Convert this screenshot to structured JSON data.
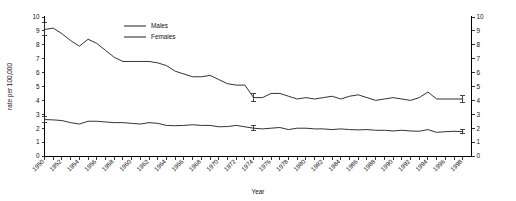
{
  "chart_data": {
    "type": "line",
    "title": "",
    "xlabel": "Year",
    "ylabel": "rate per 100,000",
    "xlim": [
      1950,
      1999
    ],
    "ylim": [
      0,
      10
    ],
    "yticks": [
      0,
      1,
      2,
      3,
      4,
      5,
      6,
      7,
      8,
      9,
      10
    ],
    "ytick_labels": [
      "0",
      "1",
      "2",
      "3",
      "4",
      "5",
      "6",
      "7",
      "8",
      "9",
      "10"
    ],
    "right_axis_mirrored": true,
    "grid": false,
    "legend_position": "top-center",
    "minor_tick_every_year": true,
    "x": [
      1950,
      1951,
      1952,
      1953,
      1954,
      1955,
      1956,
      1957,
      1958,
      1959,
      1960,
      1961,
      1962,
      1963,
      1964,
      1965,
      1966,
      1967,
      1968,
      1969,
      1970,
      1971,
      1972,
      1973,
      1974,
      1975,
      1976,
      1977,
      1978,
      1979,
      1980,
      1981,
      1982,
      1983,
      1984,
      1985,
      1986,
      1987,
      1988,
      1989,
      1990,
      1991,
      1992,
      1993,
      1994,
      1995,
      1996,
      1997,
      1998
    ],
    "xtick_labels": [
      "1950",
      "1952",
      "1954",
      "1956",
      "1958",
      "1960",
      "1962",
      "1964",
      "1966",
      "1968",
      "1970",
      "1972",
      "1974",
      "1976",
      "1978",
      "1980",
      "1982",
      "1984",
      "1986",
      "1988",
      "1990",
      "1992",
      "1994",
      "1996",
      "1998"
    ],
    "series": [
      {
        "name": "Males",
        "color": "#333333",
        "values": [
          9.1,
          9.2,
          8.8,
          8.3,
          7.9,
          8.4,
          8.1,
          7.6,
          7.1,
          6.8,
          6.8,
          6.8,
          6.8,
          6.7,
          6.5,
          6.1,
          5.9,
          5.7,
          5.7,
          5.8,
          5.5,
          5.2,
          5.1,
          5.1,
          4.2,
          4.2,
          4.5,
          4.5,
          4.3,
          4.1,
          4.2,
          4.1,
          4.2,
          4.3,
          4.1,
          4.3,
          4.4,
          4.2,
          4.0,
          4.1,
          4.2,
          4.1,
          4.0,
          4.2,
          4.6,
          4.1,
          4.1,
          4.1,
          4.1
        ],
        "error_bars": [
          {
            "year": 1950,
            "value": 9.1,
            "low": 8.7,
            "high": 9.6
          },
          {
            "year": 1974,
            "value": 4.2,
            "low": 3.9,
            "high": 4.5
          },
          {
            "year": 1998,
            "value": 4.1,
            "low": 3.85,
            "high": 4.35
          }
        ]
      },
      {
        "name": "Females",
        "color": "#333333",
        "values": [
          2.62,
          2.6,
          2.55,
          2.4,
          2.3,
          2.5,
          2.5,
          2.45,
          2.4,
          2.4,
          2.35,
          2.3,
          2.4,
          2.35,
          2.2,
          2.18,
          2.2,
          2.25,
          2.2,
          2.2,
          2.1,
          2.12,
          2.2,
          2.1,
          2.0,
          1.95,
          2.0,
          2.05,
          1.9,
          2.0,
          2.0,
          1.95,
          1.95,
          1.9,
          1.95,
          1.9,
          1.88,
          1.9,
          1.85,
          1.85,
          1.8,
          1.85,
          1.8,
          1.78,
          1.9,
          1.7,
          1.75,
          1.78,
          1.75
        ],
        "error_bars": [
          {
            "year": 1950,
            "value": 2.62,
            "low": 2.4,
            "high": 2.85
          },
          {
            "year": 1974,
            "value": 2.0,
            "low": 1.82,
            "high": 2.18
          },
          {
            "year": 1998,
            "value": 1.75,
            "low": 1.6,
            "high": 1.92
          }
        ]
      }
    ],
    "legend": [
      "Males",
      "Females"
    ]
  }
}
